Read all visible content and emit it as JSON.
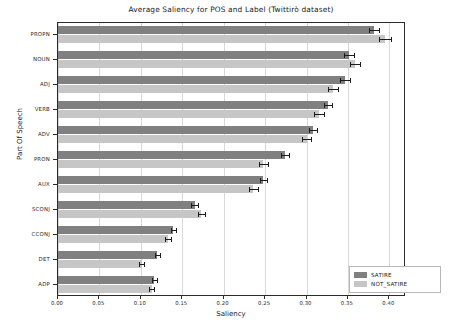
{
  "chart_data": {
    "type": "bar",
    "orientation": "horizontal",
    "title": "Average Saliency for POS and Label (Twittirò dataset)",
    "xlabel": "Saliency",
    "ylabel": "Part Of Speech",
    "categories": [
      "PROPN",
      "NOUN",
      "ADJ",
      "VERB",
      "ADV",
      "PRON",
      "AUX",
      "SCONJ",
      "CCONJ",
      "DET",
      "ADP"
    ],
    "series": [
      {
        "name": "SATIRE",
        "color": "#808080",
        "values": [
          0.381,
          0.351,
          0.347,
          0.326,
          0.308,
          0.274,
          0.248,
          0.165,
          0.139,
          0.12,
          0.116
        ],
        "errors": [
          0.006,
          0.006,
          0.006,
          0.005,
          0.005,
          0.005,
          0.004,
          0.004,
          0.003,
          0.003,
          0.003
        ]
      },
      {
        "name": "NOT_SATIRE",
        "color": "#c6c6c6",
        "values": [
          0.395,
          0.358,
          0.332,
          0.315,
          0.3,
          0.248,
          0.236,
          0.173,
          0.133,
          0.101,
          0.113
        ],
        "errors": [
          0.007,
          0.006,
          0.006,
          0.006,
          0.005,
          0.005,
          0.005,
          0.004,
          0.004,
          0.003,
          0.003
        ]
      }
    ],
    "xticks": [
      "0.00",
      "0.05",
      "0.10",
      "0.15",
      "0.20",
      "0.25",
      "0.30",
      "0.35",
      "0.40"
    ],
    "xtick_values": [
      0.0,
      0.05,
      0.1,
      0.15,
      0.2,
      0.25,
      0.3,
      0.35,
      0.4
    ],
    "xlim": [
      0.0,
      0.4201
    ],
    "grid": true,
    "legend_position": "lower right",
    "legend_entries": [
      "SATIRE",
      "NOT_SATIRE"
    ]
  }
}
